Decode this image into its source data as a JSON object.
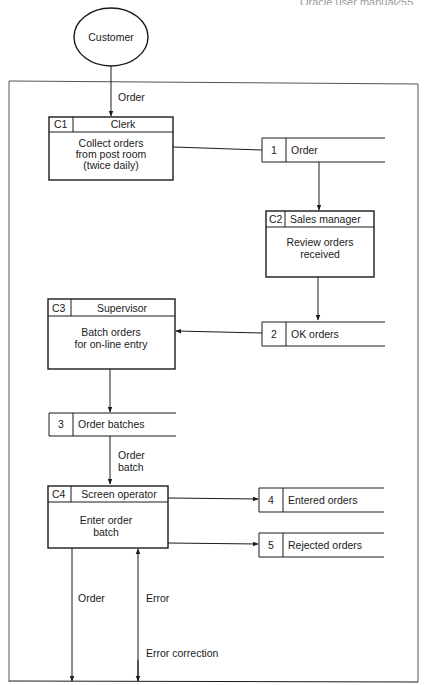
{
  "page_header": {
    "title": "Oracle user manual",
    "page_number": "255"
  },
  "external_entity": {
    "label": "Customer"
  },
  "processes": [
    {
      "id": "C1",
      "actor": "Clerk",
      "description": [
        "Collect orders",
        "from post room",
        "(twice daily)"
      ]
    },
    {
      "id": "C2",
      "actor": "Sales manager",
      "description": [
        "Review orders",
        "received"
      ]
    },
    {
      "id": "C3",
      "actor": "Supervisor",
      "description": [
        "Batch orders",
        "for on-line entry"
      ]
    },
    {
      "id": "C4",
      "actor": "Screen operator",
      "description": [
        "Enter order",
        "batch"
      ]
    }
  ],
  "data_stores": [
    {
      "id": "1",
      "label": "Order"
    },
    {
      "id": "2",
      "label": "OK orders"
    },
    {
      "id": "3",
      "label": "Order batches"
    },
    {
      "id": "4",
      "label": "Entered orders"
    },
    {
      "id": "5",
      "label": "Rejected orders"
    }
  ],
  "flows": {
    "customer_to_c1": "Order",
    "store3_to_c4": [
      "Order",
      "batch"
    ],
    "c4_out_order": "Order",
    "c4_error": "Error",
    "c4_error_correction": "Error correction"
  }
}
